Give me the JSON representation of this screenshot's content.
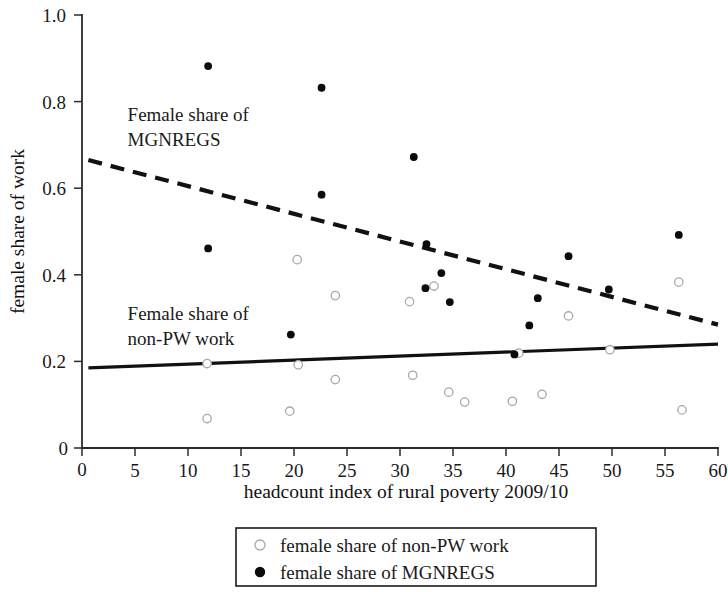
{
  "chart_data": {
    "type": "scatter",
    "title": "",
    "xlabel": "headcount index of rural poverty 2009/10",
    "ylabel": "female share of work",
    "xlim": [
      0,
      60
    ],
    "ylim": [
      0,
      1.0
    ],
    "grid": false,
    "x_ticks": [
      0,
      5,
      10,
      15,
      20,
      25,
      30,
      35,
      40,
      45,
      50,
      55,
      60
    ],
    "x_tick_labels": [
      "0",
      "5",
      "10",
      "15",
      "20",
      "25",
      "30",
      "35",
      "40",
      "45",
      "50",
      "55",
      "60"
    ],
    "y_ticks": [
      0,
      0.2,
      0.4,
      0.6,
      0.8,
      1.0
    ],
    "y_tick_labels": [
      "0",
      "0.2",
      "0.4",
      "0.6",
      "0.8",
      "1.0"
    ],
    "legend_position": "bottom-center",
    "series": [
      {
        "name": "female share of non-PW work",
        "marker": "open-circle",
        "color": "#a8a8a8",
        "points": [
          [
            11.8,
            0.195
          ],
          [
            11.8,
            0.068
          ],
          [
            19.6,
            0.085
          ],
          [
            20.3,
            0.435
          ],
          [
            20.4,
            0.192
          ],
          [
            23.9,
            0.352
          ],
          [
            23.9,
            0.158
          ],
          [
            30.9,
            0.338
          ],
          [
            31.2,
            0.168
          ],
          [
            33.2,
            0.374
          ],
          [
            34.6,
            0.129
          ],
          [
            36.1,
            0.106
          ],
          [
            40.6,
            0.108
          ],
          [
            41.2,
            0.219
          ],
          [
            43.4,
            0.124
          ],
          [
            45.9,
            0.305
          ],
          [
            49.8,
            0.227
          ],
          [
            56.3,
            0.383
          ],
          [
            56.6,
            0.088
          ]
        ]
      },
      {
        "name": "female share of MGNREGS",
        "marker": "filled-circle",
        "color": "#0b0b0b",
        "points": [
          [
            11.9,
            0.882
          ],
          [
            11.9,
            0.461
          ],
          [
            19.7,
            0.262
          ],
          [
            22.6,
            0.832
          ],
          [
            22.6,
            0.585
          ],
          [
            31.3,
            0.672
          ],
          [
            32.5,
            0.471
          ],
          [
            32.4,
            0.369
          ],
          [
            33.9,
            0.404
          ],
          [
            34.7,
            0.337
          ],
          [
            40.8,
            0.216
          ],
          [
            42.2,
            0.283
          ],
          [
            43.0,
            0.346
          ],
          [
            45.9,
            0.443
          ],
          [
            49.7,
            0.366
          ],
          [
            56.3,
            0.492
          ]
        ]
      }
    ],
    "trend_lines": [
      {
        "name": "female share of MGNREGS trend",
        "style": "dashed",
        "x_start": 0.6,
        "y_start": 0.665,
        "x_end": 60,
        "y_end": 0.285
      },
      {
        "name": "female share of non-PW work trend",
        "style": "solid",
        "x_start": 0.6,
        "y_start": 0.185,
        "x_end": 60,
        "y_end": 0.24
      }
    ],
    "annotations": [
      {
        "name": "mgnregs-annotation",
        "lines": [
          "Female share of",
          "MGNREGS"
        ],
        "x": 4.3,
        "y": 0.755
      },
      {
        "name": "non-pw-annotation",
        "lines": [
          "Female share of",
          "non-PW work"
        ],
        "x": 4.3,
        "y": 0.295
      }
    ],
    "legend": [
      {
        "label": "female share of non-PW work",
        "marker": "open-circle"
      },
      {
        "label": "female share of MGNREGS",
        "marker": "filled-circle"
      }
    ]
  }
}
